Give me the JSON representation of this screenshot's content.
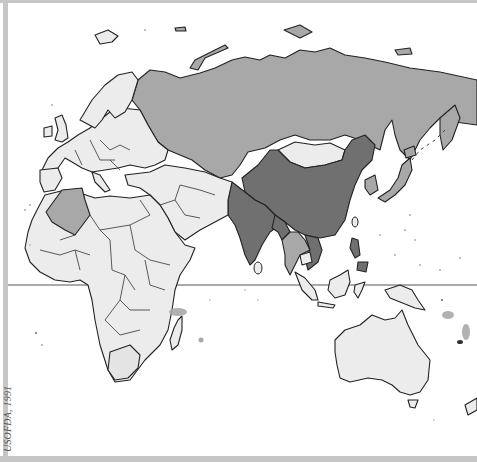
{
  "map": {
    "region": "Eastern Hemisphere (Europe, Africa, Asia, Australia)",
    "credit": "USOFDA, 1991",
    "equator_line": true,
    "colors": {
      "background": "#ffffff",
      "frame": "#c6c6c6",
      "light": "#ececec",
      "medium": "#a8a8a8",
      "dark": "#707070",
      "outline": "#222222"
    },
    "legend_categories": [
      "light",
      "medium",
      "dark"
    ],
    "shaded_regions": [
      {
        "name": "Soviet Union",
        "shade": "medium"
      },
      {
        "name": "Algeria",
        "shade": "medium"
      },
      {
        "name": "Japan",
        "shade": "medium"
      },
      {
        "name": "Korea",
        "shade": "medium"
      },
      {
        "name": "Thailand / Laos",
        "shade": "medium"
      },
      {
        "name": "Madagascar region islands",
        "shade": "medium"
      },
      {
        "name": "Pacific islands (Solomon/Vanuatu)",
        "shade": "medium"
      },
      {
        "name": "China",
        "shade": "dark"
      },
      {
        "name": "India",
        "shade": "dark"
      },
      {
        "name": "Bangladesh / Myanmar north",
        "shade": "dark"
      },
      {
        "name": "Vietnam",
        "shade": "dark"
      },
      {
        "name": "Philippines",
        "shade": "dark"
      },
      {
        "name": "Mongolia",
        "shade": "light"
      },
      {
        "name": "Africa (other)",
        "shade": "light"
      },
      {
        "name": "Europe (other)",
        "shade": "light"
      },
      {
        "name": "Australia",
        "shade": "light"
      }
    ]
  }
}
